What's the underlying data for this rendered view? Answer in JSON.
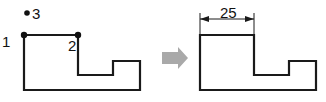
{
  "figure": {
    "background_color": "#ffffff",
    "stroke_color": "#1a1a1a",
    "arrow_color": "#a9a9a9"
  },
  "left_shape": {
    "name": "stepped-polygon-with-vertex-labels",
    "points": "24,35 78,35 78,75 113,75 113,61 140,61 140,90 24,90",
    "vertices": [
      {
        "id": "1",
        "label": "1",
        "dot": false,
        "x": 24,
        "y": 35
      },
      {
        "id": "2",
        "label": "2",
        "dot": true,
        "x": 78,
        "y": 35
      },
      {
        "id": "3",
        "label": "3",
        "dot": true,
        "x": 27,
        "y": 13
      }
    ],
    "dots": [
      {
        "name": "vertex-dot-1",
        "cx": 24,
        "cy": 35,
        "r": 3
      },
      {
        "name": "vertex-dot-2",
        "cx": 78,
        "cy": 35,
        "r": 3
      },
      {
        "name": "point-dot-3",
        "cx": 27,
        "cy": 13,
        "r": 2.6
      }
    ]
  },
  "transition_arrow": {
    "name": "right-block-arrow",
    "points": "162,52 178,52 178,47 188,58 178,69 178,64 162,64",
    "color": "#a9a9a9"
  },
  "right_shape": {
    "name": "stepped-polygon-dimensioned",
    "points": "200,35 254,35 254,75 289,75 289,61 316,61 316,90 200,90"
  },
  "dimension": {
    "value": "25",
    "label": "25",
    "line_y": 19,
    "x_start": 200,
    "x_end": 254,
    "extension_top": 13,
    "extension_bottom": 34
  }
}
